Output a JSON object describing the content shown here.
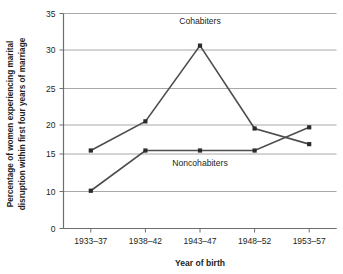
{
  "chart_data": {
    "type": "line",
    "title": "",
    "xlabel": "Year of birth",
    "ylabel_line1": "Percentage of women experiencing marital",
    "ylabel_line2": "disruption within first four years of marriage",
    "categories": [
      "1933–37",
      "1938–42",
      "1943–47",
      "1948–52",
      "1953–57"
    ],
    "yticks": [
      0,
      10,
      15,
      20,
      25,
      30,
      35
    ],
    "ytick_labels": [
      "0",
      "10",
      "15",
      "20",
      "25",
      "30",
      "35"
    ],
    "ylim": [
      0,
      35
    ],
    "grid": true,
    "legend_position": "inline-annotation",
    "series": [
      {
        "name": "Cohabiters",
        "values": [
          15.6,
          20.5,
          30.6,
          19.4,
          16.7
        ],
        "color": "#4d4d4d",
        "marker": "square"
      },
      {
        "name": "Noncohabiters",
        "values": [
          10.1,
          15.6,
          15.6,
          15.6,
          19.6
        ],
        "color": "#4d4d4d",
        "marker": "square"
      }
    ],
    "annotations": [
      {
        "text": "Cohabiters",
        "x_category_index": 2,
        "y_value": 33.6
      },
      {
        "text": "Noncohabiters",
        "x_category_index": 2,
        "y_value": 13.4
      }
    ],
    "colors": {
      "gridline": "#a8a8a8",
      "axis": "#6e6e6e",
      "line": "#4a4a4a",
      "marker": "#2b2b2b",
      "background": "#ffffff",
      "text": "#231f20"
    }
  }
}
